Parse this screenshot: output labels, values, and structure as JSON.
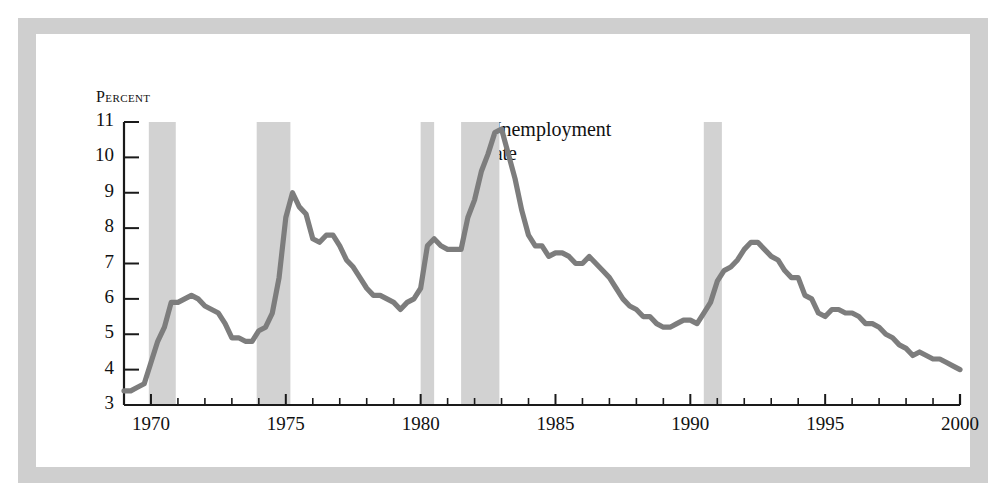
{
  "figure": {
    "y_axis_title": "Percent",
    "annotation_line1": "Unemployment",
    "annotation_line2": "rate",
    "line_color": "#7d7d7d",
    "recession_band_color": "#d2d2d2",
    "axis_color": "#1a1a1a",
    "frame_color": "#cfcfcf",
    "background_color": "#ffffff"
  },
  "chart_data": {
    "type": "line",
    "title": "",
    "subtitle": "",
    "xlabel": "",
    "ylabel": "Percent",
    "xlim": [
      1969.0,
      2000.0
    ],
    "ylim": [
      3,
      11
    ],
    "grid": false,
    "legend": "inline-annotation",
    "legend_position": "inside-plot-upper-right-of-peak",
    "ytick_labels": [
      "3",
      "4",
      "5",
      "6",
      "7",
      "8",
      "9",
      "10",
      "11"
    ],
    "yticks": [
      3,
      4,
      5,
      6,
      7,
      8,
      9,
      10,
      11
    ],
    "xtick_labels": [
      "1970",
      "1975",
      "1980",
      "1985",
      "1990",
      "1995",
      "2000"
    ],
    "xticks_major": [
      1970,
      1975,
      1980,
      1985,
      1990,
      1995,
      2000
    ],
    "xticks_minor": [
      1971,
      1972,
      1973,
      1974,
      1976,
      1977,
      1978,
      1979,
      1981,
      1982,
      1983,
      1984,
      1986,
      1987,
      1988,
      1989,
      1991,
      1992,
      1993,
      1994,
      1996,
      1997,
      1998,
      1999
    ],
    "series": [
      {
        "name": "Unemployment rate",
        "x": [
          1969.0,
          1969.25,
          1969.5,
          1969.75,
          1970.0,
          1970.25,
          1970.5,
          1970.75,
          1971.0,
          1971.25,
          1971.5,
          1971.75,
          1972.0,
          1972.25,
          1972.5,
          1972.75,
          1973.0,
          1973.25,
          1973.5,
          1973.75,
          1974.0,
          1974.25,
          1974.5,
          1974.75,
          1975.0,
          1975.25,
          1975.5,
          1975.75,
          1976.0,
          1976.25,
          1976.5,
          1976.75,
          1977.0,
          1977.25,
          1977.5,
          1977.75,
          1978.0,
          1978.25,
          1978.5,
          1978.75,
          1979.0,
          1979.25,
          1979.5,
          1979.75,
          1980.0,
          1980.25,
          1980.5,
          1980.75,
          1981.0,
          1981.25,
          1981.5,
          1981.75,
          1982.0,
          1982.25,
          1982.5,
          1982.75,
          1983.0,
          1983.25,
          1983.5,
          1983.75,
          1984.0,
          1984.25,
          1984.5,
          1984.75,
          1985.0,
          1985.25,
          1985.5,
          1985.75,
          1986.0,
          1986.25,
          1986.5,
          1986.75,
          1987.0,
          1987.25,
          1987.5,
          1987.75,
          1988.0,
          1988.25,
          1988.5,
          1988.75,
          1989.0,
          1989.25,
          1989.5,
          1989.75,
          1990.0,
          1990.25,
          1990.5,
          1990.75,
          1991.0,
          1991.25,
          1991.5,
          1991.75,
          1992.0,
          1992.25,
          1992.5,
          1992.75,
          1993.0,
          1993.25,
          1993.5,
          1993.75,
          1994.0,
          1994.25,
          1994.5,
          1994.75,
          1995.0,
          1995.25,
          1995.5,
          1995.75,
          1996.0,
          1996.25,
          1996.5,
          1996.75,
          1997.0,
          1997.25,
          1997.5,
          1997.75,
          1998.0,
          1998.25,
          1998.5,
          1998.75,
          1999.0,
          1999.25,
          1999.5,
          1999.75,
          2000.0
        ],
        "values": [
          3.4,
          3.4,
          3.5,
          3.6,
          4.2,
          4.8,
          5.2,
          5.9,
          5.9,
          6.0,
          6.1,
          6.0,
          5.8,
          5.7,
          5.6,
          5.3,
          4.9,
          4.9,
          4.8,
          4.8,
          5.1,
          5.2,
          5.6,
          6.6,
          8.3,
          9.0,
          8.6,
          8.4,
          7.7,
          7.6,
          7.8,
          7.8,
          7.5,
          7.1,
          6.9,
          6.6,
          6.3,
          6.1,
          6.1,
          6.0,
          5.9,
          5.7,
          5.9,
          6.0,
          6.3,
          7.5,
          7.7,
          7.5,
          7.4,
          7.4,
          7.4,
          8.3,
          8.8,
          9.6,
          10.1,
          10.7,
          10.8,
          10.1,
          9.4,
          8.5,
          7.8,
          7.5,
          7.5,
          7.2,
          7.3,
          7.3,
          7.2,
          7.0,
          7.0,
          7.2,
          7.0,
          6.8,
          6.6,
          6.3,
          6.0,
          5.8,
          5.7,
          5.5,
          5.5,
          5.3,
          5.2,
          5.2,
          5.3,
          5.4,
          5.4,
          5.3,
          5.6,
          5.9,
          6.5,
          6.8,
          6.9,
          7.1,
          7.4,
          7.6,
          7.6,
          7.4,
          7.2,
          7.1,
          6.8,
          6.6,
          6.6,
          6.1,
          6.0,
          5.6,
          5.5,
          5.7,
          5.7,
          5.6,
          5.6,
          5.5,
          5.3,
          5.3,
          5.2,
          5.0,
          4.9,
          4.7,
          4.6,
          4.4,
          4.5,
          4.4,
          4.3,
          4.3,
          4.2,
          4.1,
          4.0
        ]
      }
    ],
    "shaded_regions": [
      {
        "label": "recession-1969-1970",
        "start": 1969.92,
        "end": 1970.92
      },
      {
        "label": "recession-1973-1975",
        "start": 1973.92,
        "end": 1975.17
      },
      {
        "label": "recession-1980",
        "start": 1980.0,
        "end": 1980.5
      },
      {
        "label": "recession-1981-1982",
        "start": 1981.5,
        "end": 1982.92
      },
      {
        "label": "recession-1990-1991",
        "start": 1990.5,
        "end": 1991.17
      }
    ]
  }
}
